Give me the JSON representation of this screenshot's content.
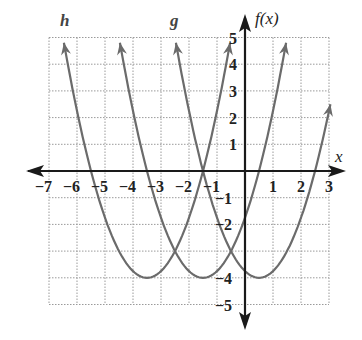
{
  "chart_data": {
    "type": "line",
    "title": "",
    "xlabel": "x",
    "ylabel": "f(x)",
    "xlim": [
      -7,
      3
    ],
    "ylim": [
      -5,
      5
    ],
    "grid": true,
    "x_ticks": [
      -7,
      -6,
      -5,
      -4,
      -3,
      -2,
      -1,
      1,
      2,
      3
    ],
    "y_ticks": [
      -5,
      -4,
      -2,
      -1,
      1,
      2,
      3,
      4,
      5
    ],
    "x_tick_labels": [
      "−7",
      "−6",
      "−5",
      "−4",
      "−3",
      "−2",
      "−1",
      "1",
      "2",
      "3"
    ],
    "y_tick_labels": [
      "5",
      "4",
      "3",
      "2",
      "1",
      "−1",
      "−2",
      "−4",
      "−5"
    ],
    "series": [
      {
        "name": "f",
        "equation": "f(x) = (x - 0.5)^2 - 4",
        "vertex": [
          0.5,
          -4
        ],
        "x_intercepts": [
          -1.5,
          2.5
        ],
        "color": "#6b6b6b"
      },
      {
        "name": "g",
        "equation": "g(x) = (x + 1.5)^2 - 4",
        "vertex": [
          -1.5,
          -4
        ],
        "x_intercepts": [
          -3.5,
          0.5
        ],
        "color": "#6b6b6b"
      },
      {
        "name": "h",
        "equation": "h(x) = (x + 3.5)^2 - 4",
        "vertex": [
          -3.5,
          -4
        ],
        "x_intercepts": [
          -5.5,
          -1.5
        ],
        "color": "#6b6b6b"
      }
    ],
    "annotations": [
      "h",
      "g",
      "f(x)",
      "x"
    ]
  },
  "labels": {
    "h": "h",
    "g": "g",
    "fx": "f(x)",
    "x": "x"
  }
}
